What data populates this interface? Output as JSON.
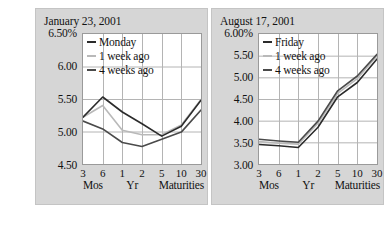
{
  "figure": {
    "background": "#ffffff",
    "panel_background": "#d6d6d6",
    "plot_background": "#ffffff",
    "grid_color": "#b4b4b4",
    "axis_color": "#9a9a9a"
  },
  "chart_data": [
    {
      "type": "line",
      "title": "January 23, 2001",
      "xlabel": "Maturities",
      "ylabel": "",
      "ylim": [
        4.5,
        6.5
      ],
      "yticks": [
        "4.50",
        "5.00",
        "5.50",
        "6.00",
        "6.50%"
      ],
      "ytick_values": [
        4.5,
        5.0,
        5.5,
        6.0,
        6.5
      ],
      "categories": [
        "3",
        "6",
        "1",
        "2",
        "5",
        "10",
        "30"
      ],
      "group_labels": [
        "Mos",
        "Yr",
        "Maturities"
      ],
      "grid": true,
      "legend_position": "top-left-inside",
      "series": [
        {
          "name": "Monday",
          "color": "#2b2b2b",
          "values": [
            5.22,
            5.53,
            5.3,
            5.12,
            4.93,
            5.08,
            5.48
          ]
        },
        {
          "name": "1 week ago",
          "color": "#b9b9b9",
          "values": [
            5.22,
            5.4,
            5.02,
            4.95,
            4.95,
            5.1,
            5.49
          ]
        },
        {
          "name": "4 weeks ago",
          "color": "#4a4a4a",
          "values": [
            5.16,
            5.04,
            4.83,
            4.77,
            4.88,
            4.99,
            5.33
          ]
        }
      ]
    },
    {
      "type": "line",
      "title": "August 17, 2001",
      "xlabel": "Maturities",
      "ylabel": "",
      "ylim": [
        3.0,
        6.0
      ],
      "yticks": [
        "3.00",
        "3.50",
        "4.00",
        "4.50",
        "5.00",
        "5.50",
        "6.00%"
      ],
      "ytick_values": [
        3.0,
        3.5,
        4.0,
        4.5,
        5.0,
        5.5,
        6.0
      ],
      "categories": [
        "3",
        "6",
        "1",
        "2",
        "5",
        "10",
        "30"
      ],
      "group_labels": [
        "Mos",
        "Yr",
        "Maturities"
      ],
      "grid": true,
      "legend_position": "top-left-inside",
      "series": [
        {
          "name": "Friday",
          "color": "#2b2b2b",
          "values": [
            3.45,
            3.42,
            3.38,
            3.85,
            4.55,
            4.88,
            5.42
          ]
        },
        {
          "name": "1 week ago",
          "color": "#b9b9b9",
          "values": [
            3.52,
            3.48,
            3.46,
            3.94,
            4.63,
            4.97,
            5.5
          ]
        },
        {
          "name": "4 weeks ago",
          "color": "#4a4a4a",
          "values": [
            3.57,
            3.53,
            3.5,
            3.99,
            4.69,
            5.03,
            5.53
          ]
        }
      ]
    }
  ]
}
